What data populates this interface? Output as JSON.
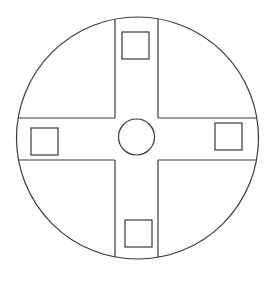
{
  "diagram": {
    "title": "",
    "stroke_color": "#3a3a3a",
    "background": "#ffffff",
    "outer_circle": {
      "cx": 137.5,
      "cy": 138,
      "r": 121
    },
    "center_circle": {
      "cx": 136.5,
      "cy": 137,
      "r": 18
    },
    "cross": {
      "vertical_band": {
        "x_left": 115,
        "x_right": 158
      },
      "horizontal_band": {
        "y_top": 118,
        "y_bottom": 160
      }
    },
    "squares": [
      {
        "name": "top",
        "x": 122,
        "y": 32,
        "w": 27,
        "h": 27
      },
      {
        "name": "left",
        "x": 31,
        "y": 128,
        "w": 27,
        "h": 27
      },
      {
        "name": "right",
        "x": 215,
        "y": 123,
        "w": 27,
        "h": 27
      },
      {
        "name": "bottom",
        "x": 125,
        "y": 220,
        "w": 27,
        "h": 27
      }
    ]
  }
}
